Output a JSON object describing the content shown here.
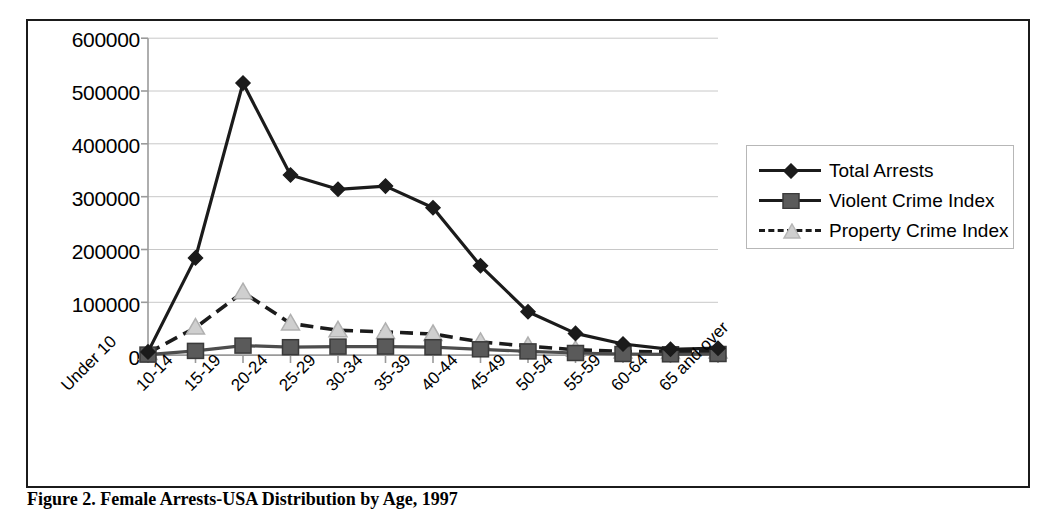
{
  "figure": {
    "caption": "Figure 2. Female Arrests-USA Distribution by Age, 1997"
  },
  "legend": {
    "position": "right",
    "items": [
      {
        "label": "Total Arrests",
        "marker": "diamond",
        "line": "solid",
        "color": "#1b1b1b"
      },
      {
        "label": "Violent Crime Index",
        "marker": "square",
        "line": "solid",
        "color": "#4d4d4d"
      },
      {
        "label": "Property Crime Index",
        "marker": "triangle",
        "line": "dashed",
        "color": "#1b1b1b"
      }
    ]
  },
  "axes": {
    "y_ticks": [
      "600000",
      "500000",
      "400000",
      "300000",
      "200000",
      "100000",
      "0"
    ],
    "x_ticks": [
      "Under 10",
      "10-14",
      "15-19",
      "20-24",
      "25-29",
      "30-34",
      "35-39",
      "40-44",
      "45-49",
      "50-54",
      "55-59",
      "60-64",
      "65 and over"
    ]
  },
  "chart_data": {
    "type": "line",
    "title": "Figure 2. Female Arrests-USA Distribution by Age, 1997",
    "xlabel": "",
    "ylabel": "",
    "ylim": [
      0,
      600000
    ],
    "ytick_step": 100000,
    "grid": true,
    "legend_position": "right",
    "categories": [
      "Under 10",
      "10-14",
      "15-19",
      "20-24",
      "25-29",
      "30-34",
      "35-39",
      "40-44",
      "45-49",
      "50-54",
      "55-59",
      "60-64",
      "65 and over"
    ],
    "series": [
      {
        "name": "Total Arrests",
        "marker": "diamond",
        "line": "solid",
        "color": "#1b1b1b",
        "values": [
          6000,
          184000,
          515000,
          341000,
          314000,
          320000,
          279000,
          169000,
          82000,
          41000,
          21000,
          11000,
          13000
        ]
      },
      {
        "name": "Violent Crime Index",
        "marker": "square",
        "line": "solid",
        "color": "#4d4d4d",
        "values": [
          1000,
          8000,
          18000,
          15000,
          16000,
          16000,
          15000,
          11000,
          7000,
          4000,
          2000,
          1500,
          2000
        ]
      },
      {
        "name": "Property Crime Index",
        "marker": "triangle",
        "line": "dashed",
        "color": "#1b1b1b",
        "values": [
          4000,
          52000,
          119000,
          60000,
          47000,
          44000,
          40000,
          25000,
          17000,
          10000,
          7000,
          6000,
          7000
        ]
      }
    ]
  }
}
